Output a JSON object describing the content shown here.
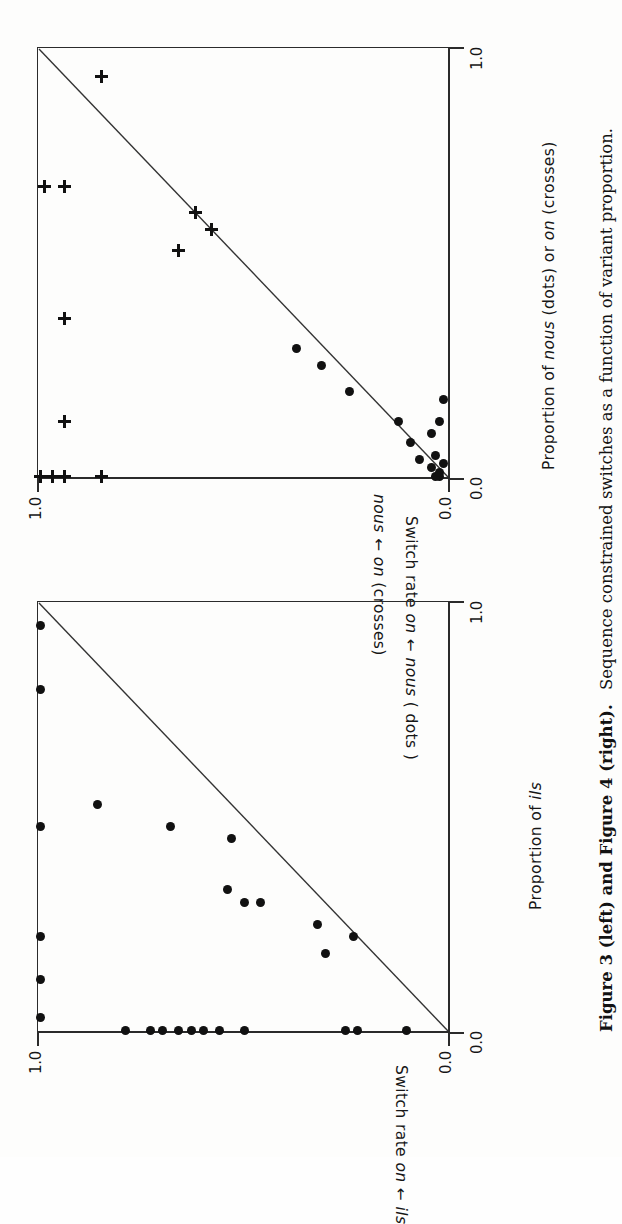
{
  "figure": {
    "caption_bold": "Figure 3 (left) and Figure 4 (right).",
    "caption_rest": "Sequence constrained switches as a function of variant proportion.",
    "orientation": "rotated-90-ccw"
  },
  "chart_data": [
    {
      "id": "figure-3",
      "type": "scatter",
      "title": "Figure 3 (left)",
      "xlabel": "Proportion of ils",
      "ylabel": "Switch rate on ← ils",
      "xlim": [
        0.0,
        1.0
      ],
      "ylim": [
        0.0,
        1.0
      ],
      "xticks": [
        "0.0",
        "1.0"
      ],
      "yticks": [
        "0.0",
        "1.0"
      ],
      "grid": false,
      "legend": "none",
      "reference_line": {
        "label": "diagonal y = 1 - x",
        "from": [
          0.0,
          1.0
        ],
        "to": [
          1.0,
          0.0
        ]
      },
      "series": [
        {
          "name": "ils switch rate (dots)",
          "marker": "dot",
          "points": [
            [
              0.0,
              0.1
            ],
            [
              0.0,
              0.22
            ],
            [
              0.0,
              0.25
            ],
            [
              0.0,
              0.5
            ],
            [
              0.0,
              0.56
            ],
            [
              0.0,
              0.6
            ],
            [
              0.0,
              0.63
            ],
            [
              0.0,
              0.66
            ],
            [
              0.0,
              0.7
            ],
            [
              0.0,
              0.73
            ],
            [
              0.0,
              0.79
            ],
            [
              0.03,
              1.0
            ],
            [
              0.12,
              1.0
            ],
            [
              0.22,
              1.0
            ],
            [
              0.48,
              1.0
            ],
            [
              0.8,
              1.0
            ],
            [
              0.95,
              1.0
            ],
            [
              0.18,
              0.3
            ],
            [
              0.22,
              0.23
            ],
            [
              0.25,
              0.32
            ],
            [
              0.3,
              0.46
            ],
            [
              0.3,
              0.5
            ],
            [
              0.33,
              0.54
            ],
            [
              0.45,
              0.53
            ],
            [
              0.48,
              0.68
            ],
            [
              0.53,
              0.86
            ]
          ]
        }
      ]
    },
    {
      "id": "figure-4",
      "type": "scatter",
      "title": "Figure 4 (right)",
      "xlabel": "Proportion of nous (dots) or on (crosses)",
      "ylabel": "Switch rate on ← nous (dots) / nous ← on (crosses)",
      "xlim": [
        0.0,
        1.0
      ],
      "ylim": [
        0.0,
        1.0
      ],
      "xticks": [
        "0.0",
        "1.0"
      ],
      "yticks": [
        "0.0",
        "1.0"
      ],
      "grid": false,
      "legend": "none",
      "reference_line": {
        "label": "diagonal y = 1 - x",
        "from": [
          0.0,
          1.0
        ],
        "to": [
          1.0,
          0.0
        ]
      },
      "series": [
        {
          "name": "nous switch rate (dots)",
          "marker": "dot",
          "points": [
            [
              0.0,
              0.02
            ],
            [
              0.0,
              0.03
            ],
            [
              0.01,
              0.02
            ],
            [
              0.02,
              0.04
            ],
            [
              0.03,
              0.01
            ],
            [
              0.04,
              0.07
            ],
            [
              0.05,
              0.03
            ],
            [
              0.08,
              0.09
            ],
            [
              0.1,
              0.04
            ],
            [
              0.13,
              0.12
            ],
            [
              0.13,
              0.02
            ],
            [
              0.2,
              0.24
            ],
            [
              0.26,
              0.31
            ],
            [
              0.3,
              0.37
            ],
            [
              0.18,
              0.01
            ]
          ]
        },
        {
          "name": "on switch rate (crosses)",
          "marker": "cross",
          "points": [
            [
              0.0,
              1.0
            ],
            [
              0.0,
              0.97
            ],
            [
              0.0,
              0.94
            ],
            [
              0.0,
              0.85
            ],
            [
              0.13,
              0.94
            ],
            [
              0.37,
              0.94
            ],
            [
              0.68,
              0.94
            ],
            [
              0.68,
              0.99
            ],
            [
              0.94,
              0.85
            ],
            [
              0.53,
              0.66
            ],
            [
              0.62,
              0.62
            ],
            [
              0.58,
              0.58
            ]
          ]
        }
      ]
    }
  ]
}
